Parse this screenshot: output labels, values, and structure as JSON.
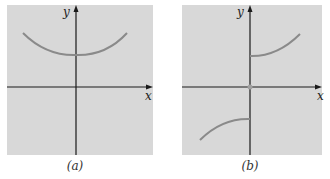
{
  "figure": {
    "background": "#ffffff",
    "panel_fill": "#d8d8d8",
    "axis_color": "#1a1a1a",
    "curve_color": "#8a8a8a",
    "panels": [
      {
        "id": "a",
        "caption": "(a)",
        "x_label": "x",
        "y_label": "y",
        "description": "U-shaped curve entirely above the x-axis, minimum on the y-axis"
      },
      {
        "id": "b",
        "caption": "(b)",
        "x_label": "x",
        "y_label": "y",
        "description": "Two branches: one rising in quadrant I starting on the positive y-axis, one in quadrant III ending on the negative y-axis; open point at origin"
      }
    ]
  }
}
